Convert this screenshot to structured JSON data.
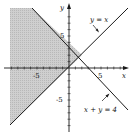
{
  "figure": {
    "type": "inequality-graph",
    "x_axis_label": "x",
    "y_axis_label": "y",
    "tick_labels": {
      "x_neg": "-5",
      "x_pos": "5",
      "y_pos": "5",
      "y_neg": "-5"
    },
    "lines": [
      {
        "equation": "y = x",
        "label": "y = x"
      },
      {
        "equation": "x + y = 4",
        "label": "x + y = 4"
      }
    ],
    "intersection": {
      "x": 2,
      "y": 2
    },
    "shaded_region": "y > x and x + y < 4 (left region)",
    "colors": {
      "shade": "#c8c8c8",
      "line": "#1a1a1a",
      "background": "#ffffff"
    }
  }
}
